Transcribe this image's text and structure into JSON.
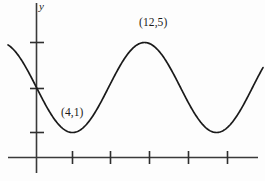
{
  "chart_data": {
    "type": "line",
    "title": "",
    "xlabel": "",
    "ylabel": "y",
    "grid": false,
    "legend": null,
    "axis": {
      "y_axis_label": "y",
      "x_tick_count": 5,
      "y_tick_count": 3,
      "x_axis_visible": true,
      "y_axis_visible": true
    },
    "annotations": [
      {
        "name": "minimum-point",
        "text": "(4,1)",
        "x": 4,
        "y": 1
      },
      {
        "name": "maximum-point",
        "text": "(12,5)",
        "x": 12,
        "y": 5
      }
    ],
    "series": [
      {
        "name": "sinusoid",
        "description": "Sinusoidal curve with minimum at (4,1) and maximum at (12,5)",
        "amplitude": 2,
        "midline": 3,
        "period": 16,
        "x": [
          -2,
          0,
          2,
          4,
          6,
          8,
          10,
          12,
          14,
          16,
          18,
          20,
          22,
          24,
          26,
          28
        ],
        "y": [
          5.0,
          4.41,
          2.41,
          1.0,
          1.59,
          3.0,
          4.41,
          5.0,
          4.41,
          3.0,
          1.59,
          1.0,
          1.59,
          3.0,
          4.41,
          5.0
        ]
      }
    ]
  },
  "colors": {
    "curve": "#1a1a1a",
    "axis": "#3a3a3a",
    "background": "#fdfdfd",
    "text": "#1a1a1a"
  },
  "labels": {
    "y_axis": "y",
    "minimum": "(4,1)",
    "maximum": "(12,5)"
  }
}
